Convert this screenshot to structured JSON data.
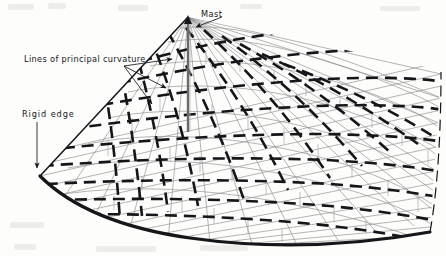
{
  "figure": {
    "kind": "engineering-line-diagram",
    "background_color": "#fdfdfc",
    "ink_color": "#15161a",
    "net_color": "#8e8e8e",
    "width": 446,
    "height": 256
  },
  "labels": {
    "mast": "Mast",
    "principal_curvature": "Lines of principal curvature",
    "rigid_edge": "Rigid edge"
  },
  "annotations": [
    {
      "name": "mast",
      "text": "Mast",
      "text_x": 201,
      "text_y": 10,
      "leader_from": [
        199,
        19
      ],
      "leader_to": [
        190,
        30
      ],
      "arrowhead": true
    },
    {
      "name": "principal-curvature",
      "text": "Lines of principal curvature",
      "text_x": 24,
      "text_y": 55,
      "leader_from": [
        130,
        66
      ],
      "leader_to": [
        174,
        60
      ],
      "arrowhead": true,
      "extra_leaders": [
        [
          [
            130,
            66
          ],
          [
            166,
            88
          ]
        ],
        [
          [
            130,
            66
          ],
          [
            152,
            104
          ]
        ]
      ]
    },
    {
      "name": "rigid-edge",
      "text": "Rigid edge",
      "text_x": 22,
      "text_y": 110,
      "leader_from": [
        37,
        122
      ],
      "leader_to": [
        37,
        170
      ],
      "arrowhead": true
    }
  ],
  "geometry": {
    "apex": [
      188,
      17
    ],
    "mast_base": [
      188,
      132
    ],
    "left_corner": [
      40,
      176
    ],
    "right_edge_x": 440,
    "ridge_lines_from_apex": [
      [
        40,
        176
      ],
      [
        150,
        206
      ],
      [
        250,
        214
      ],
      [
        330,
        196
      ],
      [
        400,
        150
      ],
      [
        434,
        104
      ],
      [
        441,
        72
      ]
    ],
    "rigid_edge_curve": "M 40,176 C 70,206 120,228 190,238 C 270,249 350,246 430,232",
    "net_u_count": 22,
    "net_v_count": 18,
    "principal_curvature_dash": "12 7",
    "principal_curvature_width": 2.6,
    "net_line_width": 0.65
  },
  "colors": {
    "ink": "#15161a",
    "net": "#8d8d8d",
    "mast": "#5c5c5c",
    "background": "#fdfdfc",
    "grain": "#dedbd6"
  }
}
